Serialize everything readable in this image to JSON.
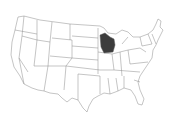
{
  "map": {
    "title": "United States map",
    "highlighted_state": "Wisconsin",
    "colors": {
      "background": "#ffffff",
      "state_fill": "#ffffff",
      "state_stroke": "#8a8a8a",
      "highlight_fill": "#3c3c3c"
    }
  }
}
